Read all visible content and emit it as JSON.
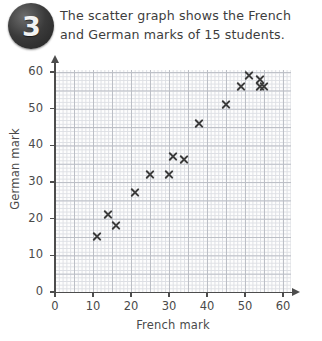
{
  "question": {
    "number": "3",
    "lines": [
      "The scatter graph shows the French",
      "and German marks of 15 students."
    ]
  },
  "chart_data": {
    "type": "scatter",
    "title": "",
    "xlabel": "French mark",
    "ylabel": "German mark",
    "xlim": [
      0,
      65
    ],
    "ylim": [
      0,
      65
    ],
    "xticks": [
      0,
      10,
      20,
      30,
      40,
      50,
      60
    ],
    "yticks": [
      0,
      10,
      20,
      30,
      40,
      50,
      60
    ],
    "xtick_labels": [
      "0",
      "10",
      "20",
      "30",
      "40",
      "50",
      "60"
    ],
    "ytick_labels": [
      "0",
      "10",
      "20",
      "30",
      "40",
      "50",
      "60"
    ],
    "grid": true,
    "grid_minor_step": 1,
    "grid_major_step": 5,
    "legend": null,
    "n_points": 15,
    "marker": "x",
    "marker_color": "#3b3b3b",
    "points": [
      {
        "x": 11,
        "y": 15
      },
      {
        "x": 14,
        "y": 21
      },
      {
        "x": 16,
        "y": 18
      },
      {
        "x": 21,
        "y": 27
      },
      {
        "x": 25,
        "y": 32
      },
      {
        "x": 30,
        "y": 32
      },
      {
        "x": 31,
        "y": 37
      },
      {
        "x": 34,
        "y": 36
      },
      {
        "x": 38,
        "y": 46
      },
      {
        "x": 45,
        "y": 51
      },
      {
        "x": 49,
        "y": 56
      },
      {
        "x": 51,
        "y": 59
      },
      {
        "x": 54,
        "y": 58
      },
      {
        "x": 54,
        "y": 56
      },
      {
        "x": 55,
        "y": 56
      }
    ]
  }
}
